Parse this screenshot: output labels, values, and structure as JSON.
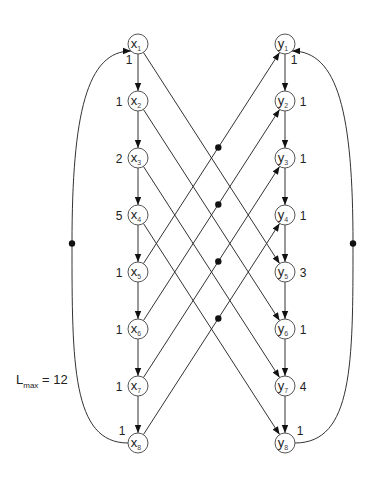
{
  "diagram": {
    "lmax": {
      "symbol": "L",
      "subscript": "max",
      "text": " = 12"
    },
    "x_nodes": [
      {
        "id": "x1",
        "letter": "x",
        "index": "1",
        "weight": "1",
        "weight_pos": "below-left"
      },
      {
        "id": "x2",
        "letter": "x",
        "index": "2",
        "weight": "1",
        "weight_pos": "left"
      },
      {
        "id": "x3",
        "letter": "x",
        "index": "3",
        "weight": "2",
        "weight_pos": "left"
      },
      {
        "id": "x4",
        "letter": "x",
        "index": "4",
        "weight": "5",
        "weight_pos": "left"
      },
      {
        "id": "x5",
        "letter": "x",
        "index": "5",
        "weight": "1",
        "weight_pos": "left"
      },
      {
        "id": "x6",
        "letter": "x",
        "index": "6",
        "weight": "1",
        "weight_pos": "left"
      },
      {
        "id": "x7",
        "letter": "x",
        "index": "7",
        "weight": "1",
        "weight_pos": "left"
      },
      {
        "id": "x8",
        "letter": "x",
        "index": "8",
        "weight": "1",
        "weight_pos": "above-left"
      }
    ],
    "y_nodes": [
      {
        "id": "y1",
        "letter": "y",
        "index": "1",
        "weight": "1",
        "weight_pos": "below-right"
      },
      {
        "id": "y2",
        "letter": "y",
        "index": "2",
        "weight": "1",
        "weight_pos": "right"
      },
      {
        "id": "y3",
        "letter": "y",
        "index": "3",
        "weight": "1",
        "weight_pos": "right"
      },
      {
        "id": "y4",
        "letter": "y",
        "index": "4",
        "weight": "1",
        "weight_pos": "right"
      },
      {
        "id": "y5",
        "letter": "y",
        "index": "5",
        "weight": "3",
        "weight_pos": "right"
      },
      {
        "id": "y6",
        "letter": "y",
        "index": "6",
        "weight": "1",
        "weight_pos": "right"
      },
      {
        "id": "y7",
        "letter": "y",
        "index": "7",
        "weight": "4",
        "weight_pos": "right"
      },
      {
        "id": "y8",
        "letter": "y",
        "index": "8",
        "weight": "1",
        "weight_pos": "above-right"
      }
    ],
    "chain_edges": [
      [
        "x1",
        "x2"
      ],
      [
        "x2",
        "x3"
      ],
      [
        "x3",
        "x4"
      ],
      [
        "x4",
        "x5"
      ],
      [
        "x5",
        "x6"
      ],
      [
        "x6",
        "x7"
      ],
      [
        "x7",
        "x8"
      ],
      [
        "y1",
        "y2"
      ],
      [
        "y2",
        "y3"
      ],
      [
        "y3",
        "y4"
      ],
      [
        "y4",
        "y5"
      ],
      [
        "y5",
        "y6"
      ],
      [
        "y6",
        "y7"
      ],
      [
        "y7",
        "y8"
      ]
    ],
    "cross_edges_down": [
      [
        "x1",
        "y5"
      ],
      [
        "x2",
        "y6"
      ],
      [
        "x3",
        "y7"
      ],
      [
        "x4",
        "y8"
      ]
    ],
    "cross_edges_up_dotted": [
      [
        "x5",
        "y1"
      ],
      [
        "x6",
        "y2"
      ],
      [
        "x7",
        "y3"
      ],
      [
        "x8",
        "y4"
      ]
    ],
    "back_arcs": [
      {
        "from": "x8",
        "to": "x1",
        "side": "left",
        "dot": true
      },
      {
        "from": "y8",
        "to": "y1",
        "side": "right",
        "dot": true
      }
    ],
    "layout": {
      "x_col": 138,
      "y_col": 285,
      "top": 44,
      "spacing": 57,
      "radius": 10,
      "left_arc_x": 72,
      "right_arc_x": 353
    }
  }
}
